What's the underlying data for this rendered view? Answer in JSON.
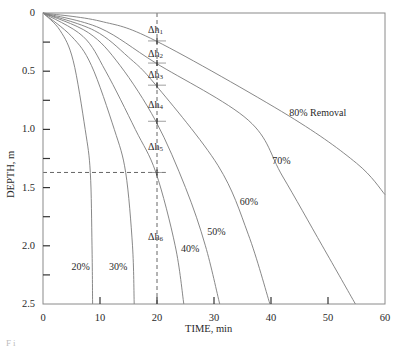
{
  "chart_data": {
    "type": "line",
    "title": "",
    "xlabel": "TIME, min",
    "ylabel": "DEPTH, m",
    "xlim": [
      0,
      60
    ],
    "ylim": [
      0,
      2.5
    ],
    "y_inverted": true,
    "grid": false,
    "legend": "none (curves labeled inline)",
    "x_ticks": [
      0,
      10,
      20,
      30,
      40,
      50,
      60
    ],
    "x_tick_labels": [
      "0",
      "10",
      "20",
      "30",
      "40",
      "50",
      "60"
    ],
    "y_ticks_major": [
      0,
      0.5,
      1.0,
      1.5,
      2.0,
      2.5
    ],
    "y_tick_labels": [
      "0",
      "0.5",
      "1.0",
      "1.5",
      "2.0",
      "2.5"
    ],
    "y_ticks_minor": [
      0.25,
      0.75,
      1.25,
      1.75,
      2.25
    ],
    "series": [
      {
        "name": "20%",
        "label": "20%",
        "label_pos": [
          5.0,
          2.18
        ],
        "points": [
          [
            0,
            0
          ],
          [
            3,
            0.15
          ],
          [
            5.3,
            0.41
          ],
          [
            7.4,
            1.0
          ],
          [
            8.3,
            1.37
          ],
          [
            8.6,
            2.0
          ],
          [
            8.7,
            2.5
          ]
        ]
      },
      {
        "name": "30%",
        "label": "30%",
        "label_pos": [
          11.6,
          2.18
        ],
        "points": [
          [
            0,
            0
          ],
          [
            5,
            0.2
          ],
          [
            8.5,
            0.45
          ],
          [
            12.5,
            1.0
          ],
          [
            14.5,
            1.37
          ],
          [
            15.7,
            2.0
          ],
          [
            16,
            2.5
          ]
        ]
      },
      {
        "name": "40%",
        "label": "40%",
        "label_pos": [
          24.2,
          2.03
        ],
        "points": [
          [
            0,
            0
          ],
          [
            7,
            0.2
          ],
          [
            11,
            0.5
          ],
          [
            16.2,
            1.0
          ],
          [
            19.8,
            1.37
          ],
          [
            23.2,
            2.0
          ],
          [
            24.7,
            2.5
          ]
        ]
      },
      {
        "name": "50%",
        "label": "50%",
        "label_pos": [
          28.8,
          1.88
        ],
        "points": [
          [
            0,
            0
          ],
          [
            8,
            0.17
          ],
          [
            13.5,
            0.45
          ],
          [
            19.8,
            0.93
          ],
          [
            25,
            1.5
          ],
          [
            28.5,
            2.0
          ],
          [
            31,
            2.5
          ]
        ]
      },
      {
        "name": "60%",
        "label": "60%",
        "label_pos": [
          34.5,
          1.62
        ],
        "points": [
          [
            0,
            0
          ],
          [
            9,
            0.15
          ],
          [
            15,
            0.38
          ],
          [
            19.8,
            0.62
          ],
          [
            30.7,
            1.31
          ],
          [
            36,
            1.9
          ],
          [
            39.8,
            2.5
          ]
        ]
      },
      {
        "name": "70%",
        "label": "70%",
        "label_pos": [
          40.2,
          1.27
        ],
        "points": [
          [
            0,
            0
          ],
          [
            10,
            0.13
          ],
          [
            19.8,
            0.43
          ],
          [
            36,
            0.92
          ],
          [
            42,
            1.4
          ],
          [
            49,
            2.0
          ],
          [
            54.8,
            2.5
          ]
        ]
      },
      {
        "name": "80%",
        "label": "80% Removal",
        "label_pos": [
          43.2,
          0.86
        ],
        "points": [
          [
            0,
            0
          ],
          [
            10,
            0.07
          ],
          [
            19.8,
            0.24
          ],
          [
            43,
            0.88
          ],
          [
            55,
            1.29
          ],
          [
            60,
            1.56
          ]
        ]
      }
    ],
    "annotations": {
      "vertical_dashed_line": {
        "x": 20,
        "y_from": 0,
        "y_to": 2.5
      },
      "horizontal_dashed_line": {
        "y": 1.37,
        "x_from": 0,
        "x_to": 21.5
      },
      "intersection_marks_depths": [
        0.24,
        0.43,
        0.62,
        0.93,
        1.37
      ],
      "delta_h_labels": [
        {
          "base": "Δh",
          "sub": "1",
          "depth": 0.155
        },
        {
          "base": "Δh",
          "sub": "2",
          "depth": 0.36
        },
        {
          "base": "Δh",
          "sub": "3",
          "depth": 0.545
        },
        {
          "base": "Δh",
          "sub": "4",
          "depth": 0.8
        },
        {
          "base": "Δh",
          "sub": "5",
          "depth": 1.16
        },
        {
          "base": "Δh",
          "sub": "6",
          "depth": 1.93
        }
      ]
    }
  },
  "caption_partial": "Fi"
}
